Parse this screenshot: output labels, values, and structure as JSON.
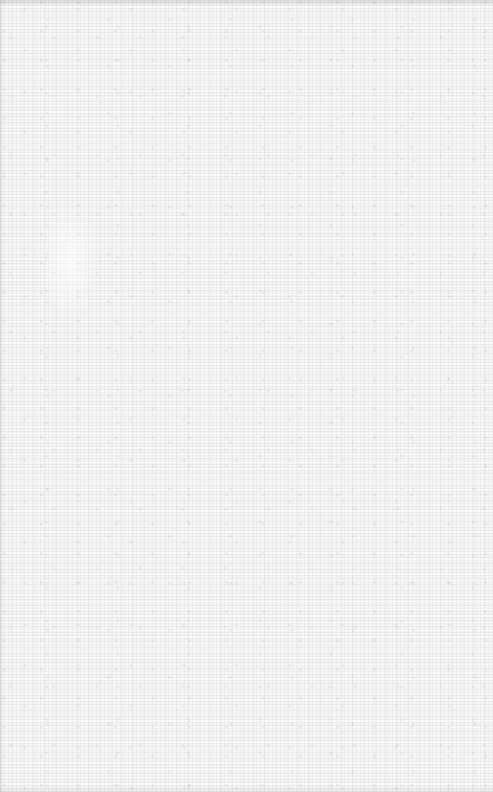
{
  "surface": {
    "description": "blank textured paper/linen surface",
    "base_color": "#f5f5f5",
    "texture_color": "#d8d8d8",
    "text_content": []
  }
}
